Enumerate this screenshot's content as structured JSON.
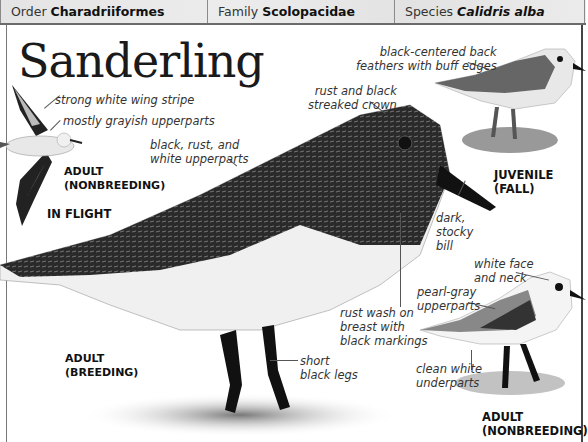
{
  "header": {
    "order": {
      "label": "Order",
      "value": "Charadriiformes"
    },
    "family": {
      "label": "Family",
      "value": "Scolopacidae"
    },
    "species": {
      "label": "Species",
      "value": "Calidris alba"
    }
  },
  "title": "Sanderling",
  "annotations": {
    "wing_stripe": "strong white wing stripe",
    "grayish_upperparts": "mostly grayish upperparts",
    "breeding_upperparts_1": "black, rust, and",
    "breeding_upperparts_2": "white upperparts",
    "crown_1": "rust and black",
    "crown_2": "streaked crown",
    "back_feathers_1": "black-centered back",
    "back_feathers_2": "feathers with buff edges",
    "bill_1": "dark,",
    "bill_2": "stocky",
    "bill_3": "bill",
    "face_1": "white face",
    "face_2": "and neck",
    "pearl_1": "pearl-gray",
    "pearl_2": "upperparts",
    "breast_1": "rust wash on",
    "breast_2": "breast with",
    "breast_3": "black markings",
    "legs_1": "short",
    "legs_2": "black legs",
    "underparts_1": "clean white",
    "underparts_2": "underparts"
  },
  "captions": {
    "flight_adult_1": "ADULT",
    "flight_adult_2": "(NONBREEDING)",
    "in_flight": "IN FLIGHT",
    "juvenile_1": "JUVENILE",
    "juvenile_2": "(FALL)",
    "breeding_1": "ADULT",
    "breeding_2": "(BREEDING)",
    "nonbreeding_1": "ADULT",
    "nonbreeding_2": "(NONBREEDING)"
  }
}
